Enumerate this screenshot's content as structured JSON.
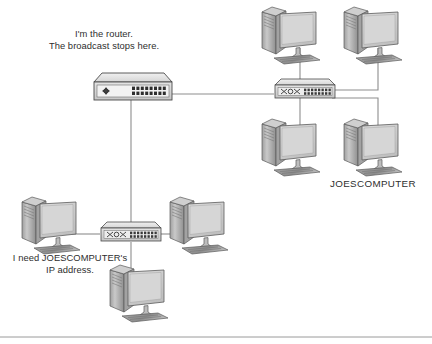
{
  "diagram": {
    "type": "network-topology",
    "annotations": {
      "router_callout_line1": "I'm the router.",
      "router_callout_line2": "The broadcast stops here.",
      "request_callout_line1": "I need JOESCOMPUTER's",
      "request_callout_line2": "IP address.",
      "joescomputer_label": "JOESCOMPUTER"
    },
    "devices": [
      {
        "id": "router",
        "kind": "router",
        "label": "I'm the router. The broadcast stops here.",
        "x": 90,
        "y": 70
      },
      {
        "id": "switch-right",
        "kind": "switch",
        "label": "",
        "x": 272,
        "y": 76
      },
      {
        "id": "switch-bottom",
        "kind": "switch",
        "label": "",
        "x": 98,
        "y": 219
      },
      {
        "id": "pc-top-left",
        "kind": "computer",
        "label": "",
        "x": 258,
        "y": 6
      },
      {
        "id": "pc-top-right",
        "kind": "computer",
        "label": "",
        "x": 345,
        "y": 6
      },
      {
        "id": "pc-mid-left",
        "kind": "computer",
        "label": "",
        "x": 258,
        "y": 118
      },
      {
        "id": "pc-joescomputer",
        "kind": "computer",
        "label": "JOESCOMPUTER",
        "x": 345,
        "y": 118
      },
      {
        "id": "pc-left",
        "kind": "computer",
        "label": "",
        "x": 22,
        "y": 196
      },
      {
        "id": "pc-right",
        "kind": "computer",
        "label": "",
        "x": 168,
        "y": 196
      },
      {
        "id": "pc-bottom",
        "kind": "computer",
        "label": "",
        "x": 108,
        "y": 264
      }
    ],
    "links": [
      {
        "from": "router",
        "to": "switch-right",
        "style": "straight"
      },
      {
        "from": "router",
        "to": "switch-bottom",
        "style": "straight"
      },
      {
        "from": "switch-right",
        "to": "pc-top-left",
        "style": "straight"
      },
      {
        "from": "switch-right",
        "to": "pc-top-right",
        "style": "elbow"
      },
      {
        "from": "switch-right",
        "to": "pc-mid-left",
        "style": "straight"
      },
      {
        "from": "switch-right",
        "to": "pc-joescomputer",
        "style": "elbow"
      },
      {
        "from": "switch-bottom",
        "to": "pc-left",
        "style": "straight"
      },
      {
        "from": "switch-bottom",
        "to": "pc-right",
        "style": "straight"
      },
      {
        "from": "switch-bottom",
        "to": "pc-bottom",
        "style": "straight"
      }
    ],
    "colors": {
      "line": "#8a8a8a",
      "device_body": "#d8d8d8",
      "device_top": "#e8e8e8",
      "device_outline": "#4a4a4a",
      "screen": "#cfcfcf",
      "tower": "#b8b8b8",
      "text": "#2e2e2e",
      "rule": "#9a9a9a",
      "background": "#ffffff"
    },
    "footer_rule": true
  }
}
